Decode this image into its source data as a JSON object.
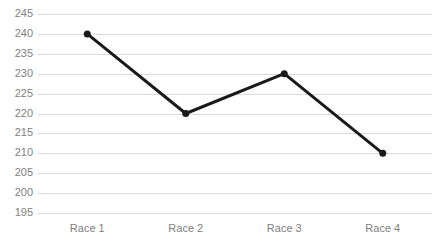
{
  "chart_data": {
    "type": "line",
    "title": "",
    "xlabel": "",
    "ylabel": "",
    "categories": [
      "Race 1",
      "Race 2",
      "Race 3",
      "Race 4"
    ],
    "values": [
      240,
      220,
      230,
      210
    ],
    "series": [
      {
        "name": "Series 1",
        "values": [
          240,
          220,
          230,
          210
        ]
      }
    ],
    "ylim": [
      195,
      245
    ],
    "ytick_step": 5,
    "yticks": [
      245,
      240,
      235,
      230,
      225,
      220,
      215,
      210,
      205,
      200,
      195
    ],
    "ytick_labels": [
      "245",
      "240",
      "235",
      "230",
      "225",
      "220",
      "215",
      "210",
      "205",
      "200",
      "195"
    ],
    "grid": "horizontal",
    "legend": "none",
    "markers": "circle",
    "colors": {
      "line": "#1a1a1a",
      "marker": "#1a1a1a",
      "gridline": "#d9d9d9",
      "tick_label": "#808080",
      "background": "#ffffff"
    },
    "line_width": 3,
    "marker_size": 7
  }
}
